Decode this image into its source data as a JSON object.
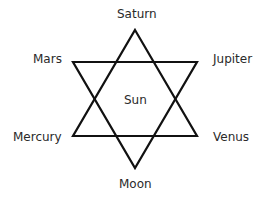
{
  "diagram": {
    "type": "hexagram",
    "center_label": "Sun",
    "nodes": {
      "top": "Saturn",
      "upper_left": "Mars",
      "upper_right": "Jupiter",
      "lower_left": "Mercury",
      "lower_right": "Venus",
      "bottom": "Moon"
    },
    "stroke_color": "#111111"
  }
}
